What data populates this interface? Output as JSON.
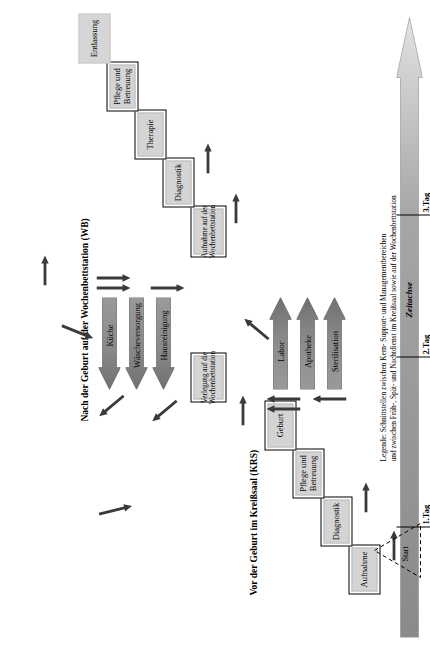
{
  "diagram": {
    "title_krs": "Vor der Geburt im Kreißsaal (KRS)",
    "title_wb": "Nach der Geburt auf der Wochenbettstation (WB)",
    "start_label": "Start",
    "time_axis_label": "Zeitachse",
    "day_ticks": [
      "1.Tag",
      "2.Tag",
      "3.Tag"
    ],
    "legend_line1": "Legende: Schnittstellen zwischen Kern- Support- und Managementbereichen",
    "legend_line2": "und zwischen Früh-, Spät- und Nachtdienst im Kreißsaal sowie auf der Wochenbettstation",
    "krs_steps": [
      {
        "label": "Aufnahme"
      },
      {
        "label": "Diagnostik"
      },
      {
        "label": "Pflege und Betreuung"
      },
      {
        "label": "Geburt"
      }
    ],
    "transfer_step": {
      "label": "Verlegung auf die Wochenbettstation"
    },
    "wb_steps": [
      {
        "label": "Aufnahme auf der Wochenbettstation"
      },
      {
        "label": "Diagnostik"
      },
      {
        "label": "Therapie"
      },
      {
        "label": "Pflege und Betreuung"
      },
      {
        "label": "Entlassung"
      }
    ],
    "support_arrows": [
      {
        "label": "Labor"
      },
      {
        "label": "Apotheke"
      },
      {
        "label": "Sterilisation"
      }
    ],
    "service_arrows": [
      {
        "label": "Küche"
      },
      {
        "label": "Wäscheversorgung"
      },
      {
        "label": "Hausreinigung"
      }
    ],
    "colors": {
      "box_fill": "#d4d4d4",
      "box_border": "#000000",
      "arrow_fill_dark": "#8a8a8a",
      "arrow_fill_light": "#e8e8e8",
      "interface_arrow": "#3a3a3a",
      "time_axis_dark": "#8a8a8a",
      "time_axis_light": "#d9d9d9"
    }
  }
}
